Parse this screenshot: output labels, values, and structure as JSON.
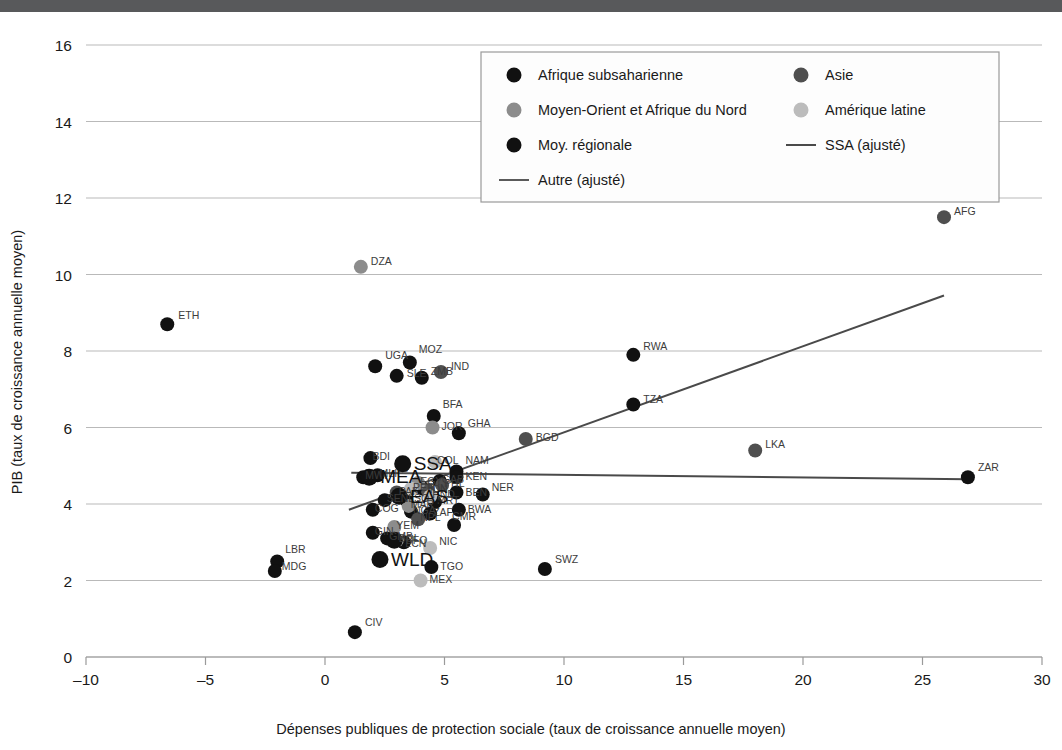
{
  "figure": {
    "topbar_color": "#58595b",
    "background": "#ffffff"
  },
  "chart_data": {
    "type": "scatter",
    "title": "",
    "xlabel": "Dépenses publiques de protection sociale (taux de croissance annuelle moyen)",
    "ylabel": "PIB (taux de croissance annuelle moyen)",
    "xlim": [
      -10,
      30
    ],
    "ylim": [
      0,
      16
    ],
    "xticks": [
      -10,
      -5,
      0,
      5,
      10,
      15,
      20,
      25,
      30
    ],
    "xticklabels": [
      "–10",
      "–5",
      "0",
      "5",
      "10",
      "15",
      "20",
      "25",
      "30"
    ],
    "yticks": [
      0,
      2,
      4,
      6,
      8,
      10,
      12,
      14,
      16
    ],
    "yticklabels": [
      "0",
      "2",
      "4",
      "6",
      "8",
      "10",
      "12",
      "14",
      "16"
    ],
    "grid": "horizontal",
    "legend_position": "top-center",
    "series": [
      {
        "name": "Afrique subsaharienne",
        "key": "ssa",
        "color": "#111111",
        "marker": "circle",
        "radius": 7,
        "points": [
          {
            "label": "ETH",
            "x": -6.6,
            "y": 8.7,
            "dx": 11,
            "dy": -5
          },
          {
            "label": "UGA",
            "x": 2.1,
            "y": 7.6,
            "dx": 10,
            "dy": -7
          },
          {
            "label": "SLE",
            "x": 3.0,
            "y": 7.35,
            "dx": 10,
            "dy": 1
          },
          {
            "label": "MOZ",
            "x": 3.55,
            "y": 7.7,
            "dx": 9,
            "dy": -9
          },
          {
            "label": "ZMB",
            "x": 4.05,
            "y": 7.3,
            "dx": 9,
            "dy": -3
          },
          {
            "label": "BFA",
            "x": 4.55,
            "y": 6.3,
            "dx": 9,
            "dy": -8
          },
          {
            "label": "GHA",
            "x": 5.6,
            "y": 5.85,
            "dx": 9,
            "dy": -6
          },
          {
            "label": "RWA",
            "x": 12.9,
            "y": 7.9,
            "dx": 10,
            "dy": -5
          },
          {
            "label": "TZA",
            "x": 12.9,
            "y": 6.6,
            "dx": 10,
            "dy": -2
          },
          {
            "label": "ZAR",
            "x": 26.9,
            "y": 4.7,
            "dx": 10,
            "dy": -6
          },
          {
            "label": "SWZ",
            "x": 9.2,
            "y": 2.3,
            "dx": 10,
            "dy": -6
          },
          {
            "label": "CIV",
            "x": 1.25,
            "y": 0.65,
            "dx": 10,
            "dy": -6
          },
          {
            "label": "LBR",
            "x": -2.0,
            "y": 2.5,
            "dx": 8,
            "dy": -8
          },
          {
            "label": "MDG",
            "x": -2.1,
            "y": 2.25,
            "dx": 7,
            "dy": -1
          },
          {
            "label": "NAM",
            "x": 5.5,
            "y": 4.85,
            "dx": 9,
            "dy": -7
          },
          {
            "label": "KEN",
            "x": 5.5,
            "y": 4.7,
            "dx": 9,
            "dy": 0
          },
          {
            "label": "BEN",
            "x": 5.5,
            "y": 4.3,
            "dx": 9,
            "dy": 0
          },
          {
            "label": "NER",
            "x": 6.6,
            "y": 4.25,
            "dx": 9,
            "dy": -3
          },
          {
            "label": "BWA",
            "x": 5.6,
            "y": 3.85,
            "dx": 9,
            "dy": 0
          },
          {
            "label": "CMR",
            "x": 5.4,
            "y": 3.45,
            "dx": -2,
            "dy": -5
          },
          {
            "label": "TGO",
            "x": 4.45,
            "y": 2.35,
            "dx": 9,
            "dy": 0
          },
          {
            "label": "TUN",
            "x": 4.1,
            "y": 4.4,
            "dx": 3,
            "dy": 0
          },
          {
            "label": "ZAF",
            "x": 4.4,
            "y": 3.75,
            "dx": 3,
            "dy": 2
          },
          {
            "label": "NGA",
            "x": 3.6,
            "y": 3.8,
            "dx": 2,
            "dy": 2
          },
          {
            "label": "SEN",
            "x": 2.5,
            "y": 4.1,
            "dx": 2,
            "dy": 2
          },
          {
            "label": "MLI",
            "x": 2.2,
            "y": 4.75,
            "dx": 2,
            "dy": 2
          },
          {
            "label": "MWI",
            "x": 1.6,
            "y": 4.7,
            "dx": 2,
            "dy": 2
          },
          {
            "label": "BDI",
            "x": 1.9,
            "y": 5.2,
            "dx": 2,
            "dy": 2
          },
          {
            "label": "COG",
            "x": 2.0,
            "y": 3.85,
            "dx": 2,
            "dy": 2
          },
          {
            "label": "GIN",
            "x": 2.0,
            "y": 3.25,
            "dx": 2,
            "dy": 2
          },
          {
            "label": "GMB",
            "x": 2.6,
            "y": 3.1,
            "dx": 2,
            "dy": 2
          },
          {
            "label": "BFO",
            "x": 3.3,
            "y": 3.0,
            "dx": 2,
            "dy": 2
          },
          {
            "label": "LSO",
            "x": 3.4,
            "y": 4.1,
            "dx": 2,
            "dy": 2
          },
          {
            "label": "MRT",
            "x": 4.6,
            "y": 4.05,
            "dx": 2,
            "dy": 2
          },
          {
            "label": "GAB",
            "x": 4.8,
            "y": 4.6,
            "dx": 2,
            "dy": 2
          }
        ]
      },
      {
        "name": "Asie",
        "key": "asia",
        "color": "#4f4f4f",
        "marker": "circle",
        "radius": 7,
        "points": [
          {
            "label": "AFG",
            "x": 25.9,
            "y": 11.5,
            "dx": 10,
            "dy": -2
          },
          {
            "label": "IND",
            "x": 4.85,
            "y": 7.45,
            "dx": 10,
            "dy": -2
          },
          {
            "label": "BGD",
            "x": 8.4,
            "y": 5.7,
            "dx": 10,
            "dy": 2
          },
          {
            "label": "LKA",
            "x": 18.0,
            "y": 5.4,
            "dx": 10,
            "dy": -2
          },
          {
            "label": "PHL",
            "x": 4.9,
            "y": 4.5,
            "dx": 2,
            "dy": 2
          },
          {
            "label": "IDN",
            "x": 4.3,
            "y": 4.35,
            "dx": 2,
            "dy": 2
          },
          {
            "label": "NPL",
            "x": 3.9,
            "y": 3.6,
            "dx": 2,
            "dy": 2
          },
          {
            "label": "PAK",
            "x": 3.0,
            "y": 4.3,
            "dx": 2,
            "dy": 2
          }
        ]
      },
      {
        "name": "Moyen-Orient et Afrique du Nord",
        "key": "mena",
        "color": "#8c8c8c",
        "marker": "circle",
        "radius": 7,
        "points": [
          {
            "label": "DZA",
            "x": 1.5,
            "y": 10.2,
            "dx": 10,
            "dy": -2
          },
          {
            "label": "JOR",
            "x": 4.5,
            "y": 6.0,
            "dx": 9,
            "dy": 2
          },
          {
            "label": "EGY",
            "x": 3.9,
            "y": 4.55,
            "dx": 2,
            "dy": 2
          },
          {
            "label": "MAR",
            "x": 3.5,
            "y": 3.95,
            "dx": 2,
            "dy": 2
          },
          {
            "label": "YEM",
            "x": 2.9,
            "y": 3.4,
            "dx": 2,
            "dy": 2
          }
        ]
      },
      {
        "name": "Amérique latine",
        "key": "lac",
        "color": "#bcbcbc",
        "marker": "circle",
        "radius": 7,
        "points": [
          {
            "label": "NIC",
            "x": 4.4,
            "y": 2.85,
            "dx": 9,
            "dy": -3
          },
          {
            "label": "MEX",
            "x": 4.0,
            "y": 2.0,
            "dx": 9,
            "dy": 2
          },
          {
            "label": "COL",
            "x": 4.6,
            "y": 5.1,
            "dx": 2,
            "dy": 2
          },
          {
            "label": "PER",
            "x": 3.6,
            "y": 4.4,
            "dx": 2,
            "dy": 2
          },
          {
            "label": "BOL",
            "x": 3.0,
            "y": 3.05,
            "dx": 2,
            "dy": 2
          },
          {
            "label": "HND",
            "x": 4.4,
            "y": 4.2,
            "dx": 2,
            "dy": 2
          }
        ]
      },
      {
        "name": "Moy. régionale",
        "key": "regional",
        "color": "#111111",
        "marker": "circle",
        "radius": 8.5,
        "points": [
          {
            "label": "SSA",
            "x": 3.25,
            "y": 5.05,
            "dx": 11,
            "dy": 6,
            "big": true
          },
          {
            "label": "MEA",
            "x": 1.85,
            "y": 4.7,
            "dx": 11,
            "dy": 6,
            "big": true
          },
          {
            "label": "EAS",
            "x": 3.1,
            "y": 4.2,
            "dx": 11,
            "dy": 7,
            "big": true
          },
          {
            "label": "LCN",
            "x": 2.9,
            "y": 3.05,
            "dx": 11,
            "dy": 7,
            "big": false
          },
          {
            "label": "WLD",
            "x": 2.3,
            "y": 2.55,
            "dx": 11,
            "dy": 7,
            "big": true
          }
        ]
      }
    ],
    "fit_lines": [
      {
        "name": "SSA (ajusté)",
        "key": "ssa_fit",
        "color": "#4a4a4a",
        "x1": 1.0,
        "y1": 3.85,
        "x2": 25.9,
        "y2": 9.45
      },
      {
        "name": "Autre (ajusté)",
        "key": "other_fit",
        "color": "#5a5a5a",
        "x1": 1.1,
        "y1": 4.82,
        "x2": 26.9,
        "y2": 4.65
      }
    ]
  },
  "legend": {
    "entries": [
      {
        "label": "Afrique subsaharienne",
        "type": "marker",
        "color": "#111111",
        "col": 0,
        "row": 0
      },
      {
        "label": "Asie",
        "type": "marker",
        "color": "#4f4f4f",
        "col": 1,
        "row": 0
      },
      {
        "label": "Moyen-Orient et Afrique du Nord",
        "type": "marker",
        "color": "#8c8c8c",
        "col": 0,
        "row": 1
      },
      {
        "label": "Amérique latine",
        "type": "marker",
        "color": "#bcbcbc",
        "col": 1,
        "row": 1
      },
      {
        "label": "Moy. régionale",
        "type": "marker",
        "color": "#111111",
        "col": 0,
        "row": 2
      },
      {
        "label": "SSA (ajusté)",
        "type": "line",
        "color": "#4a4a4a",
        "col": 1,
        "row": 2
      },
      {
        "label": "Autre (ajusté)",
        "type": "line",
        "color": "#5a5a5a",
        "col": 0,
        "row": 3
      }
    ]
  }
}
